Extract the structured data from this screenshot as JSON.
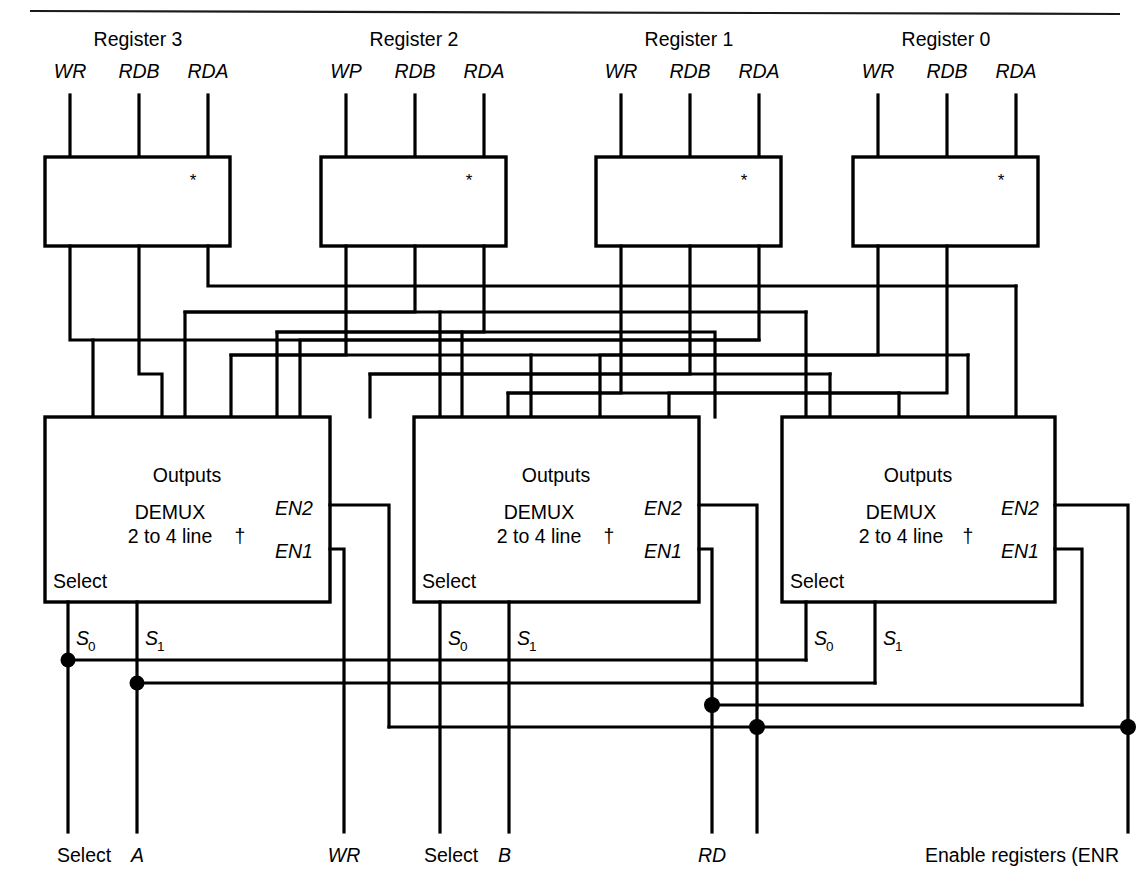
{
  "figure": {
    "top_rule": true
  },
  "registers": [
    {
      "name": "Register 3",
      "pins": [
        "WR",
        "RDB",
        "RDA"
      ],
      "marker": "*"
    },
    {
      "name": "Register 2",
      "pins": [
        "WP",
        "RDB",
        "RDA"
      ],
      "marker": "*"
    },
    {
      "name": "Register 1",
      "pins": [
        "WR",
        "RDB",
        "RDA"
      ],
      "marker": "*"
    },
    {
      "name": "Register 0",
      "pins": [
        "WR",
        "RDB",
        "RDA"
      ],
      "marker": "*"
    }
  ],
  "demuxes": [
    {
      "outputs_label": "Outputs",
      "type_line1": "DEMUX",
      "type_line2": "2 to 4 line",
      "dagger": "†",
      "en2": "EN2",
      "en1": "EN1",
      "select_label": "Select",
      "select_pins": [
        "S",
        "S"
      ],
      "select_subs": [
        "0",
        "1"
      ]
    },
    {
      "outputs_label": "Outputs",
      "type_line1": "DEMUX",
      "type_line2": "2 to 4 line",
      "dagger": "†",
      "en2": "EN2",
      "en1": "EN1",
      "select_label": "Select",
      "select_pins": [
        "S",
        "S"
      ],
      "select_subs": [
        "0",
        "1"
      ]
    },
    {
      "outputs_label": "Outputs",
      "type_line1": "DEMUX",
      "type_line2": "2 to 4 line",
      "dagger": "†",
      "en2": "EN2",
      "en1": "EN1",
      "select_label": "Select",
      "select_pins": [
        "S",
        "S"
      ],
      "select_subs": [
        "0",
        "1"
      ]
    }
  ],
  "bottom_inputs": [
    {
      "label_plain": "Select ",
      "label_italic": "A"
    },
    {
      "label_plain": "",
      "label_italic": "WR"
    },
    {
      "label_plain": "Select ",
      "label_italic": "B"
    },
    {
      "label_plain": "",
      "label_italic": "RD"
    },
    {
      "label_plain": "Enable registers (ENR",
      "label_italic": ""
    }
  ],
  "colors": {
    "line": "#000000",
    "background": "#ffffff",
    "rule": "#1a1a1a"
  }
}
